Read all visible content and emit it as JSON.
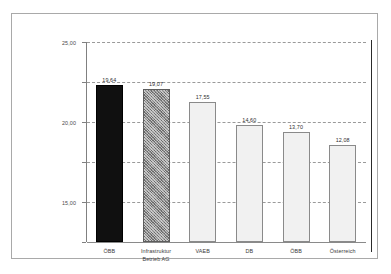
{
  "chart_data": {
    "type": "bar",
    "title": "",
    "subtitle": "",
    "xlabel": "",
    "ylabel": "",
    "ylim": [
      0,
      25
    ],
    "grid": true,
    "legend": false,
    "decimal_separator": ",",
    "categories": [
      "ÖBB",
      "Infrastruktur\nBetrieb AG",
      "VAEB",
      "DB",
      "ÖBB",
      "Österreich"
    ],
    "values": [
      19.64,
      19.07,
      17.55,
      14.6,
      13.7,
      12.08
    ],
    "value_labels": [
      "19,64",
      "19,07",
      "17,55",
      "14,60",
      "13,70",
      "12,08"
    ],
    "bar_styles": [
      "black",
      "hatch",
      "light",
      "light",
      "light",
      "light"
    ],
    "yticks": [
      0,
      5,
      10,
      15,
      20,
      25
    ],
    "ytick_labels": [
      "0,00",
      "5,00",
      "10,00",
      "15,00",
      "20,00",
      "25,00"
    ]
  },
  "colors": {
    "frame": "#a9a9a9",
    "axis": "#808080",
    "gridline": "#9a9a9a",
    "bar_black": "#101010",
    "bar_hatch": "#8d8d8d",
    "bar_light": "#f1f1f1",
    "bar_border": "#7d7d7d",
    "rule": "#2b2b2b",
    "background": "#ffffff"
  }
}
